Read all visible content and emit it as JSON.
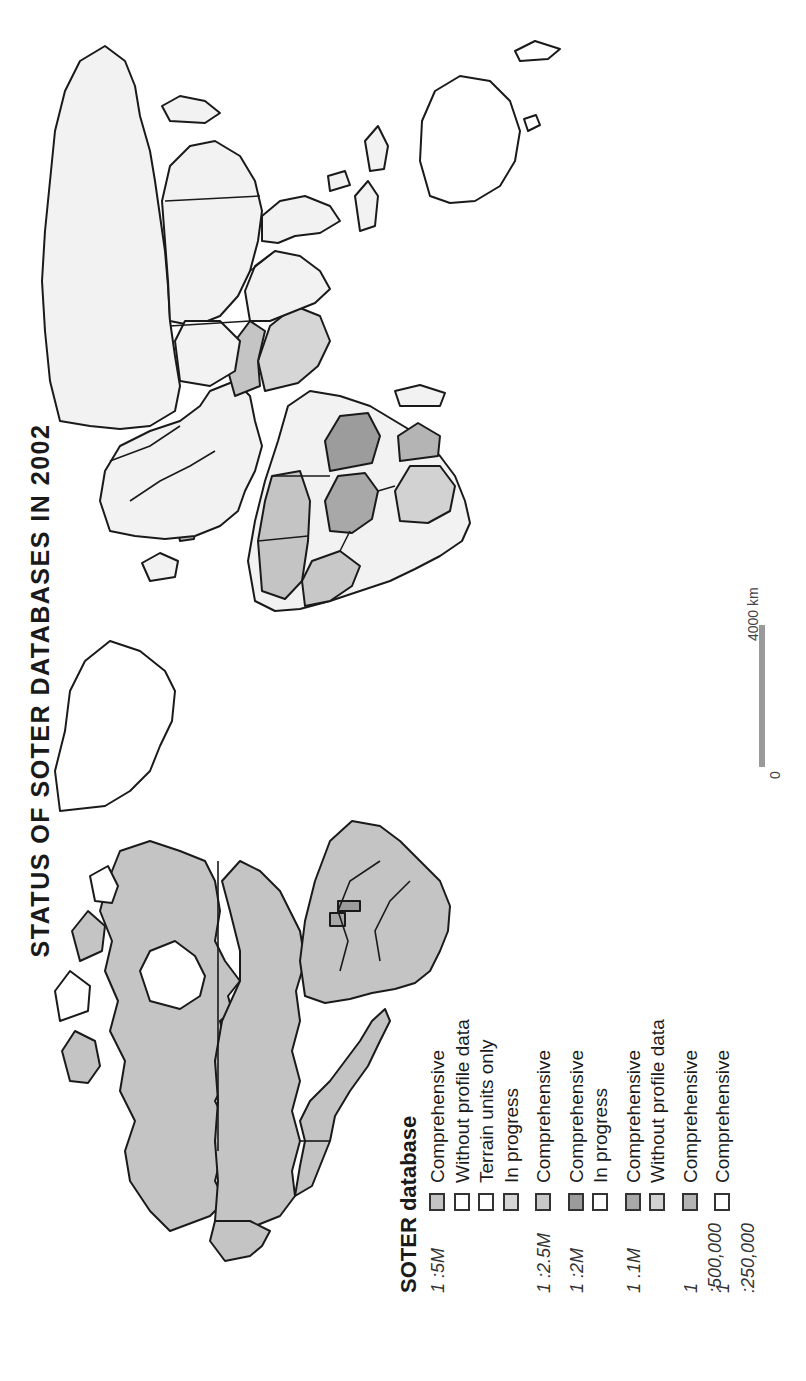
{
  "title": "STATUS OF SOTER DATABASES IN 2002",
  "colors": {
    "background": "#ffffff",
    "outline": "#1a1a1a",
    "comprehensive_5m": "#c4c4c4",
    "in_progress_5m": "#d6d6d6",
    "comprehensive_2_5m": "#c8c8c8",
    "comprehensive_2m": "#9c9c9c",
    "comprehensive_1m": "#a8a8a8",
    "without_profile_1m": "#d2d2d2",
    "comprehensive_500k": "#b4b4b4",
    "no_data": "#f2f2f2",
    "white": "#ffffff",
    "scalebar": "#9a9a9a"
  },
  "legend": {
    "title": "SOTER database",
    "rows": [
      {
        "scale": "1 :5M",
        "label": "Comprehensive",
        "swatch": "#c4c4c4"
      },
      {
        "scale": "",
        "label": "Without profile data",
        "swatch": "#ffffff"
      },
      {
        "scale": "",
        "label": "Terrain units only",
        "swatch": "#ffffff"
      },
      {
        "scale": "",
        "label": "In progress",
        "swatch": "#d6d6d6"
      },
      {
        "scale": "1 :2.5M",
        "label": "Comprehensive",
        "swatch": "#c8c8c8"
      },
      {
        "scale": "1 :2M",
        "label": "Comprehensive",
        "swatch": "#9c9c9c"
      },
      {
        "scale": "",
        "label": "In progress",
        "swatch": "#ffffff"
      },
      {
        "scale": "1 .1M",
        "label": "Comprehensive",
        "swatch": "#a8a8a8"
      },
      {
        "scale": "",
        "label": "Without profile data",
        "swatch": "#d2d2d2"
      },
      {
        "scale": "1 :500,000",
        "label": "Comprehensive",
        "swatch": "#b4b4b4"
      },
      {
        "scale": "1 :250,000",
        "label": "Comprehensive",
        "swatch": "#ffffff"
      }
    ]
  },
  "scalebar": {
    "min_label": "0",
    "max_label": "4000 km"
  },
  "regions": [
    {
      "name": "North America (Canada/USA/Mexico)",
      "status": "1:5M Comprehensive"
    },
    {
      "name": "Central America",
      "status": "1:5M Comprehensive"
    },
    {
      "name": "South America",
      "status": "1:5M Comprehensive"
    },
    {
      "name": "Greenland",
      "status": "No data"
    },
    {
      "name": "Europe",
      "status": "No data"
    },
    {
      "name": "Africa",
      "status": "Mixed 1:5M / 1:2.5M / 1:1M"
    },
    {
      "name": "Middle East",
      "status": "1:5M In progress"
    },
    {
      "name": "Russia / Northern Asia",
      "status": "No data"
    },
    {
      "name": "China / Mongolia",
      "status": "No data"
    },
    {
      "name": "South Asia",
      "status": "No data"
    },
    {
      "name": "Southeast Asia",
      "status": "No data"
    },
    {
      "name": "Australia",
      "status": "No data"
    }
  ]
}
